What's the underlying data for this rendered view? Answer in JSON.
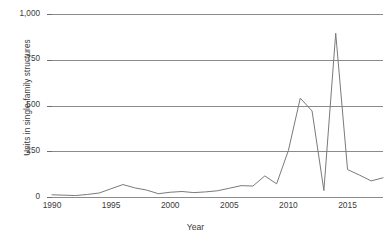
{
  "chart_data": {
    "type": "line",
    "title": "",
    "xlabel": "Year",
    "ylabel": "Units in single-family structures",
    "xlim": [
      1990,
      2018
    ],
    "ylim": [
      0,
      1000
    ],
    "grid": true,
    "legend": false,
    "legend_position": "none",
    "line_color": "#7a7a7a",
    "xticks": [
      "1990",
      "1995",
      "2000",
      "2005",
      "2010",
      "2015"
    ],
    "xtick_values": [
      1990,
      1995,
      2000,
      2005,
      2010,
      2015
    ],
    "yticks": [
      "0",
      "250",
      "500",
      "750",
      "1,000"
    ],
    "ytick_values": [
      0,
      250,
      500,
      750,
      1000
    ],
    "x": [
      1990,
      1991,
      1992,
      1993,
      1994,
      1995,
      1996,
      1997,
      1998,
      1999,
      2000,
      2001,
      2002,
      2003,
      2004,
      2005,
      2006,
      2007,
      2008,
      2009,
      2010,
      2011,
      2012,
      2013,
      2014,
      2015,
      2016,
      2017,
      2018
    ],
    "values": [
      12,
      10,
      8,
      14,
      22,
      45,
      68,
      50,
      38,
      18,
      26,
      30,
      24,
      28,
      34,
      48,
      62,
      60,
      115,
      72,
      255,
      540,
      470,
      35,
      895,
      150,
      120,
      88,
      105
    ],
    "series": [
      {
        "name": "Units in single-family structures",
        "values": [
          12,
          10,
          8,
          14,
          22,
          45,
          68,
          50,
          38,
          18,
          26,
          30,
          24,
          28,
          34,
          48,
          62,
          60,
          115,
          72,
          255,
          540,
          470,
          35,
          895,
          150,
          120,
          88,
          105
        ]
      }
    ],
    "annotations": []
  }
}
